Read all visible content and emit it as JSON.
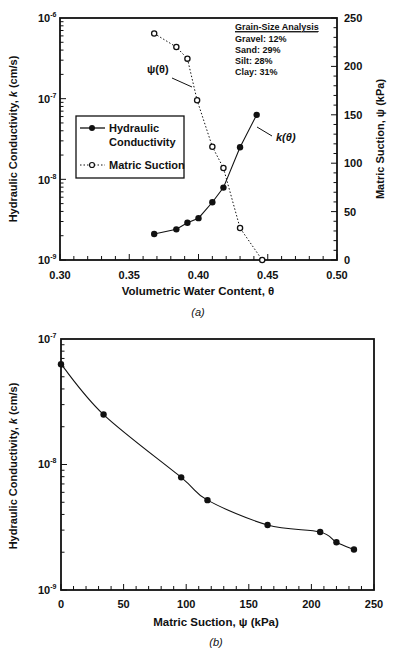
{
  "chart_data": [
    {
      "id": "a",
      "type": "line",
      "caption": "(a)",
      "title": "",
      "xlabel": "Volumetric Water Content, θ",
      "ylabel": "Hydraulic Conductivity, k (cm/s)",
      "y2label": "Matric Suction, ψ (kPa)",
      "xlim": [
        0.3,
        0.5
      ],
      "ylim": [
        1e-09,
        1e-06
      ],
      "yscale": "log",
      "y2lim": [
        0,
        250
      ],
      "x_ticks": [
        "0.30",
        "0.35",
        "0.40",
        "0.45",
        "0.50"
      ],
      "y_ticks": [
        "10⁻⁹",
        "10⁻⁸",
        "10⁻⁷",
        "10⁻⁶"
      ],
      "y2_ticks": [
        "0",
        "50",
        "100",
        "150",
        "200",
        "250"
      ],
      "grid": false,
      "legend_position": "middle-left",
      "series": [
        {
          "name": "Hydraulic Conductivity",
          "axis": "left",
          "style": "solid line, filled circles",
          "annotation": "k(θ)",
          "x": [
            0.368,
            0.384,
            0.392,
            0.4,
            0.41,
            0.418,
            0.43,
            0.442
          ],
          "values": [
            2.1e-09,
            2.4e-09,
            2.9e-09,
            3.3e-09,
            5.2e-09,
            7.9e-09,
            2.5e-08,
            6.3e-08
          ]
        },
        {
          "name": "Matric Suction",
          "axis": "right",
          "style": "dotted line, open circles",
          "annotation": "ψ(θ)",
          "x": [
            0.368,
            0.384,
            0.392,
            0.399,
            0.41,
            0.418,
            0.43,
            0.446
          ],
          "values": [
            234,
            220,
            208,
            165,
            117,
            95,
            33,
            0
          ]
        }
      ],
      "inset_text": {
        "heading": "Grain-Size Analysis",
        "lines": [
          "Gravel: 12%",
          "Sand: 29%",
          "Silt: 28%",
          "Clay: 31%"
        ]
      }
    },
    {
      "id": "b",
      "type": "line",
      "caption": "(b)",
      "title": "",
      "xlabel": "Matric Suction, ψ (kPa)",
      "ylabel": "Hydraulic Conductivity, k (cm/s)",
      "xlim": [
        0,
        250
      ],
      "ylim": [
        1e-09,
        1e-07
      ],
      "yscale": "log",
      "x_ticks": [
        "0",
        "50",
        "100",
        "150",
        "200",
        "250"
      ],
      "y_ticks": [
        "10⁻⁹",
        "10⁻⁸",
        "10⁻⁷"
      ],
      "grid": false,
      "series": [
        {
          "name": "Hydraulic Conductivity",
          "style": "smooth solid line, filled circles",
          "x": [
            0,
            34,
            96,
            117,
            165,
            207,
            220,
            234
          ],
          "values": [
            6.3e-08,
            2.5e-08,
            7.9e-09,
            5.2e-09,
            3.3e-09,
            2.9e-09,
            2.4e-09,
            2.1e-09
          ]
        }
      ]
    }
  ],
  "labels": {
    "a_xlabel_main": "Volumetric Water Content,",
    "a_xlabel_sym": "θ",
    "a_ylabel_pre": "Hydraulic Conductivity,",
    "a_ylabel_k": "k",
    "a_ylabel_post": "(cm/s)",
    "a_y2label": "Matric Suction, ψ (kPa)",
    "a_caption": "(a)",
    "b_xlabel": "Matric Suction, ψ (kPa)",
    "b_caption": "(b)",
    "legend_k": "Hydraulic",
    "legend_k2": "Conductivity",
    "legend_psi": "Matric Suction",
    "annot_psi": "ψ(θ)",
    "annot_k": "k(θ)",
    "grain_heading": "Grain-Size Analysis",
    "grain_0": "Gravel: 12%",
    "grain_1": "Sand: 29%",
    "grain_2": "Silt: 28%",
    "grain_3": "Clay: 31%",
    "x_a": [
      "0.30",
      "0.35",
      "0.40",
      "0.45",
      "0.50"
    ],
    "y2_a": [
      "0",
      "50",
      "100",
      "150",
      "200",
      "250"
    ],
    "x_b": [
      "0",
      "50",
      "100",
      "150",
      "200",
      "250"
    ]
  }
}
